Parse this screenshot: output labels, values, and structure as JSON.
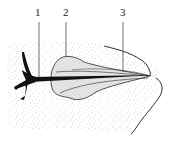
{
  "figure": {
    "labels": [
      {
        "id": "1",
        "text": "1",
        "x": 35,
        "y": 7
      },
      {
        "id": "2",
        "text": "2",
        "x": 63,
        "y": 7
      },
      {
        "id": "3",
        "text": "3",
        "x": 120,
        "y": 7
      }
    ],
    "colors": {
      "ink": "#1a1a1a",
      "stipple": "#9a9a9a",
      "organ_fill": "#e2e2e2",
      "background": "#ffffff"
    }
  }
}
